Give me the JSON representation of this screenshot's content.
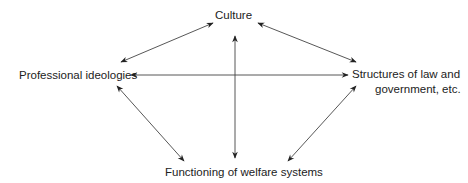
{
  "diagram": {
    "nodes": {
      "culture": "Culture",
      "professional": "Professional ideologies",
      "structures_line1": "Structures of law and",
      "structures_line2": "government, etc.",
      "functioning": "Functioning of welfare systems"
    },
    "edges": [
      {
        "from": "Culture",
        "to": "Professional ideologies",
        "type": "bidirectional"
      },
      {
        "from": "Culture",
        "to": "Structures of law and government, etc.",
        "type": "bidirectional"
      },
      {
        "from": "Culture",
        "to": "Functioning of welfare systems",
        "type": "bidirectional"
      },
      {
        "from": "Professional ideologies",
        "to": "Structures of law and government, etc.",
        "type": "bidirectional"
      },
      {
        "from": "Professional ideologies",
        "to": "Functioning of welfare systems",
        "type": "bidirectional"
      },
      {
        "from": "Structures of law and government, etc.",
        "to": "Functioning of welfare systems",
        "type": "bidirectional"
      }
    ],
    "colors": {
      "line": "#333333",
      "text": "#222222",
      "background": "#ffffff"
    }
  }
}
